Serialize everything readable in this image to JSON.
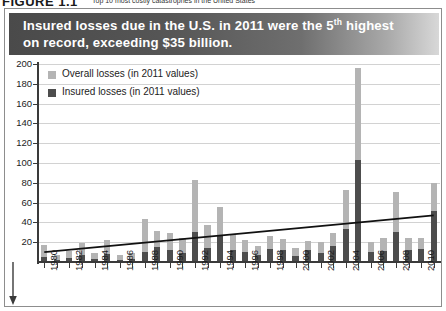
{
  "figure": {
    "number": "FIGURE 1.1",
    "caption": "Top 10 most costly catastrophes in the United States"
  },
  "title": {
    "line1_a": "Insured losses due in the U.S. in 2011 were the 5",
    "line1_sup": "th",
    "line1_b": " highest",
    "line2": "on record, exceeding $35 billion."
  },
  "legend": {
    "overall": "Overall losses (in 2011 values)",
    "insured": "Insured losses (in 2011 values)"
  },
  "colors": {
    "overall": "#b4b4b4",
    "insured": "#4d4d4d",
    "trend": "#111111",
    "axis": "#3a3a3a",
    "grid": "#d2d2d2",
    "banner_dark": "#4a4a4a",
    "banner_light": "#d8d8d8"
  },
  "chart_data": {
    "type": "bar",
    "title": "Insured losses due in the U.S. in 2011 were the 5th highest on record, exceeding $35 billion.",
    "subtitle": "",
    "xlabel": "",
    "ylabel": "",
    "ylim": [
      0,
      200
    ],
    "yticks": [
      20,
      40,
      60,
      80,
      100,
      120,
      140,
      160,
      180,
      200
    ],
    "grid": true,
    "legend_position": "top-left",
    "stacked": true,
    "categories": [
      "1980",
      "1981",
      "1982",
      "1983",
      "1984",
      "1985",
      "1986",
      "1987",
      "1988",
      "1989",
      "1990",
      "1991",
      "1992",
      "1993",
      "1994",
      "1995",
      "1996",
      "1997",
      "1998",
      "1999",
      "2000",
      "2001",
      "2002",
      "2003",
      "2004",
      "2005",
      "2006",
      "2007",
      "2008",
      "2009",
      "2010",
      "2011"
    ],
    "xtick_labels": [
      "1980",
      "1982",
      "1984",
      "1986",
      "1988",
      "1990",
      "1992",
      "1994",
      "1996",
      "1998",
      "2000",
      "2002",
      "2004",
      "2006",
      "2008",
      "2010"
    ],
    "series": [
      {
        "name": "Overall losses (in 2011 values)",
        "color": "#b4b4b4",
        "values": [
          17,
          7,
          11,
          19,
          9,
          22,
          7,
          9,
          43,
          31,
          29,
          24,
          83,
          37,
          56,
          28,
          22,
          16,
          26,
          23,
          14,
          21,
          20,
          29,
          73,
          196,
          20,
          24,
          71,
          24,
          24,
          80
        ]
      },
      {
        "name": "Insured losses (in 2011 values)",
        "color": "#4d4d4d",
        "values": [
          5,
          2,
          4,
          7,
          3,
          8,
          2,
          3,
          10,
          15,
          12,
          9,
          30,
          14,
          27,
          12,
          10,
          7,
          13,
          12,
          6,
          12,
          9,
          16,
          33,
          103,
          10,
          11,
          30,
          12,
          13,
          52
        ]
      }
    ],
    "trend_line": {
      "name": "Trend",
      "color": "#111111",
      "start": {
        "x": "1980",
        "y": 10
      },
      "end": {
        "x": "2011",
        "y": 47
      }
    }
  }
}
